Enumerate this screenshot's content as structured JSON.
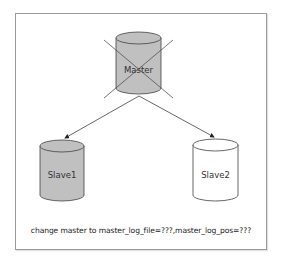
{
  "diagram": {
    "nodes": [
      {
        "id": "master",
        "label": "Master",
        "fill": "#c0c0c0",
        "crossed_out": true
      },
      {
        "id": "slave1",
        "label": "Slave1",
        "fill": "#c0c0c0",
        "crossed_out": false
      },
      {
        "id": "slave2",
        "label": "Slave2",
        "fill": "#ffffff",
        "crossed_out": false
      }
    ],
    "edges": [
      {
        "from": "master",
        "to": "slave1",
        "type": "arrow"
      },
      {
        "from": "master",
        "to": "slave2",
        "type": "arrow"
      }
    ],
    "caption": "change master to master_log_file=???,master_log_pos=???",
    "colors": {
      "stroke": "#404040",
      "gray_fill": "#c0c0c0",
      "white_fill": "#ffffff",
      "frame_border": "#9a9a9a"
    }
  }
}
